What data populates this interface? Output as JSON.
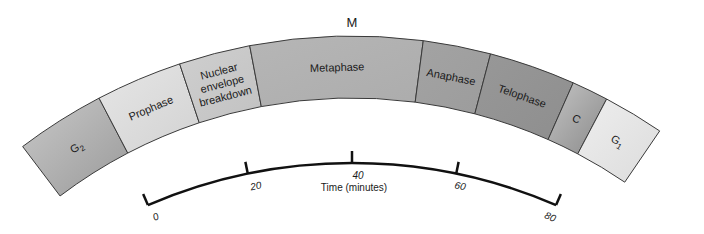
{
  "title": "M",
  "cell_cycle_arc": {
    "segments": [
      {
        "id": "g2",
        "label": "G2",
        "sub": "2",
        "base": "G",
        "start_deg": -37.1,
        "end_deg": -27.6,
        "color_a": "#c8c8c8",
        "color_b": "#9a9a9a"
      },
      {
        "id": "prophase",
        "label": "Prophase",
        "start_deg": -27.6,
        "end_deg": -18.4,
        "color_a": "#e6e6e6",
        "color_b": "#d2d2d2"
      },
      {
        "id": "nuclear-envelope-breakdown",
        "label_lines": [
          "Nuclear",
          "envelope",
          "breakdown"
        ],
        "start_deg": -18.4,
        "end_deg": -10.8,
        "color_a": "#cfcfcf",
        "color_b": "#c2c2c2"
      },
      {
        "id": "metaphase",
        "label": "Metaphase",
        "start_deg": -10.8,
        "end_deg": 7.5,
        "color_a": "#b6b6b6",
        "color_b": "#acacac"
      },
      {
        "id": "anaphase",
        "label": "Anaphase",
        "start_deg": 7.5,
        "end_deg": 14.7,
        "color_a": "#a3a3a3",
        "color_b": "#9c9c9c"
      },
      {
        "id": "telophase",
        "label": "Telophase",
        "start_deg": 14.7,
        "end_deg": 23.9,
        "color_a": "#989898",
        "color_b": "#8e8e8e"
      },
      {
        "id": "cytokinesis",
        "label": "C",
        "start_deg": 23.9,
        "end_deg": 27.8,
        "color_a": "#c4c4c4",
        "color_b": "#8a8a8a"
      },
      {
        "id": "g1",
        "label": "G1",
        "base": "G",
        "sub": "1",
        "start_deg": 27.8,
        "end_deg": 34.3,
        "color_a": "#eeeeee",
        "color_b": "#dcdcdc"
      }
    ]
  },
  "timeline": {
    "axis_title": "Time (minutes)",
    "ticks": [
      {
        "value": 0,
        "label": "0"
      },
      {
        "value": 20,
        "label": "20"
      },
      {
        "value": 40,
        "label": "40"
      },
      {
        "value": 60,
        "label": "60"
      },
      {
        "value": 80,
        "label": "80"
      }
    ]
  }
}
